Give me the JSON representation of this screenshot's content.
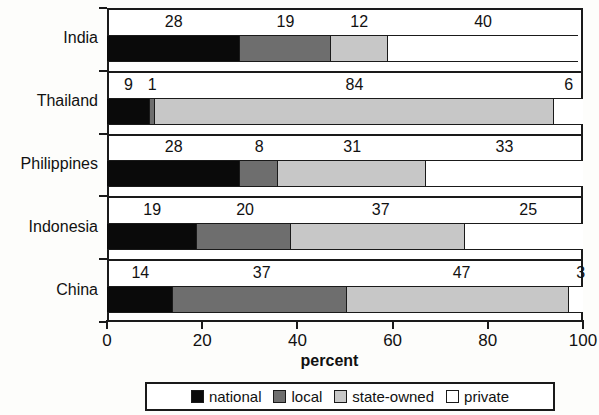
{
  "chart_data": {
    "type": "bar",
    "orientation": "horizontal",
    "stacked": true,
    "stacked_percent": true,
    "title": "",
    "xlabel": "percent",
    "ylabel": "",
    "xlim": [
      0,
      100
    ],
    "xticks": [
      0,
      20,
      40,
      60,
      80,
      100
    ],
    "xticklabels": [
      "0",
      "20",
      "40",
      "60",
      "80",
      "100"
    ],
    "grid": false,
    "legend_position": "bottom",
    "categories": [
      "India",
      "Thailand",
      "Philippines",
      "Indonesia",
      "China"
    ],
    "series": [
      {
        "name": "national",
        "color": "#0a0a0a",
        "values": [
          28,
          9,
          28,
          19,
          14
        ]
      },
      {
        "name": "local",
        "color": "#6e6e6e",
        "values": [
          19,
          1,
          8,
          20,
          37
        ]
      },
      {
        "name": "state-owned",
        "color": "#c7c7c7",
        "values": [
          12,
          84,
          31,
          37,
          47
        ]
      },
      {
        "name": "private",
        "color": "#ffffff",
        "values": [
          40,
          6,
          33,
          25,
          3
        ]
      }
    ],
    "data_labels": {
      "India": [
        "28",
        "19",
        "12",
        "40"
      ],
      "Thailand": [
        "9",
        "1",
        "84",
        "6"
      ],
      "Philippines": [
        "28",
        "8",
        "31",
        "33"
      ],
      "Indonesia": [
        "19",
        "20",
        "37",
        "25"
      ],
      "China": [
        "14",
        "37",
        "47",
        "3"
      ]
    }
  },
  "legend": {
    "items": [
      {
        "label": "national",
        "swatch": "national"
      },
      {
        "label": "local",
        "swatch": "local"
      },
      {
        "label": "state-owned",
        "swatch": "stateowned"
      },
      {
        "label": "private",
        "swatch": "private"
      }
    ]
  },
  "axis": {
    "x_title": "percent"
  }
}
